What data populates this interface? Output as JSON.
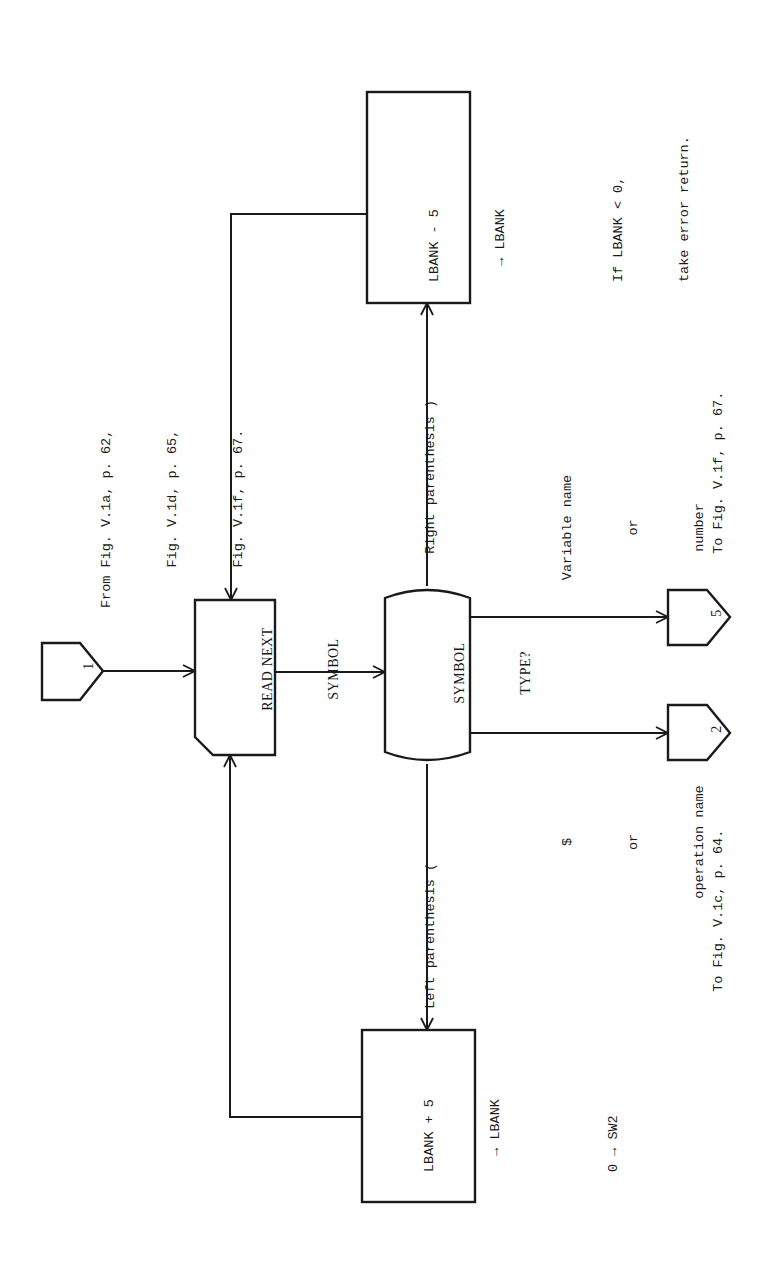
{
  "figure": {
    "orientation": "rotated-90-ccw",
    "line_color": "#1a1a1a",
    "background": "#ffffff"
  },
  "source_note": {
    "lines": [
      "From Fig. V.1a, p. 62,",
      "     Fig. V.1d, p. 65,",
      "     Fig. V.1f, p. 67."
    ]
  },
  "nodes": {
    "entry_connector": {
      "label": "1",
      "shape": "off-page-connector"
    },
    "read_symbol": {
      "lines": [
        "READ NEXT",
        "SYMBOL"
      ],
      "shape": "input-card"
    },
    "symbol_type": {
      "lines": [
        "SYMBOL",
        "TYPE?"
      ],
      "shape": "decision-terminal"
    },
    "decrement_box": {
      "lines": [
        "LBANK - 5",
        "  → LBANK",
        "",
        "If LBANK < 0,",
        "take error return."
      ],
      "shape": "process"
    },
    "increment_box": {
      "lines": [
        "LBANK + 5",
        "  → LBANK",
        "",
        "0 → SW2"
      ],
      "shape": "process"
    },
    "exit_connector_5": {
      "label": "5",
      "shape": "off-page-connector"
    },
    "exit_connector_2": {
      "label": "2",
      "shape": "off-page-connector"
    }
  },
  "edges": {
    "right_paren": {
      "label": "Right parenthesis )"
    },
    "left_paren": {
      "label": "Left parenthesis ("
    },
    "variable": {
      "lines": [
        "Variable name",
        "or",
        "number"
      ]
    },
    "operation": {
      "lines": [
        "$",
        "or",
        "operation name"
      ]
    }
  },
  "destinations": {
    "to_5": "To Fig. V.1f, p. 67.",
    "to_2": "To Fig. V.1c, p. 64."
  }
}
